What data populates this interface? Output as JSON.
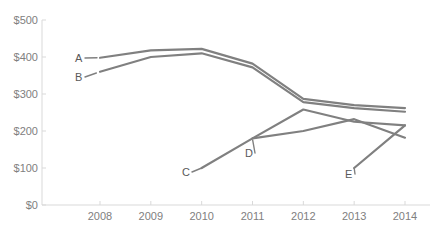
{
  "chart_data": {
    "type": "line",
    "title": "",
    "xlabel": "",
    "ylabel": "",
    "x": [
      2008,
      2009,
      2010,
      2011,
      2012,
      2013,
      2014
    ],
    "categories": [
      "2008",
      "2009",
      "2010",
      "2011",
      "2012",
      "2013",
      "2014"
    ],
    "ylim": [
      0,
      500
    ],
    "ytick_values": [
      0,
      100,
      200,
      300,
      400,
      500
    ],
    "ytick_labels": [
      "$0",
      "$100",
      "$200",
      "$300",
      "$400",
      "$500"
    ],
    "grid": false,
    "legend": "inline-labels",
    "line_color": "#808080",
    "axis_color": "#d9d9d9",
    "text_color": "#808080",
    "series": [
      {
        "name": "A",
        "label": "A",
        "x": [
          2008,
          2009,
          2010,
          2011,
          2012,
          2013,
          2014
        ],
        "values": [
          398,
          418,
          422,
          382,
          287,
          270,
          262
        ]
      },
      {
        "name": "B",
        "label": "B",
        "x": [
          2008,
          2009,
          2010,
          2011,
          2012,
          2013,
          2014
        ],
        "values": [
          360,
          400,
          410,
          372,
          278,
          262,
          252
        ]
      },
      {
        "name": "C",
        "label": "C",
        "x": [
          2010,
          2011,
          2012,
          2013,
          2014
        ],
        "values": [
          100,
          180,
          258,
          225,
          215
        ]
      },
      {
        "name": "D",
        "label": "D",
        "x": [
          2011,
          2012,
          2013,
          2014
        ],
        "values": [
          180,
          200,
          232,
          182
        ]
      },
      {
        "name": "E",
        "label": "E",
        "x": [
          2013,
          2014
        ],
        "values": [
          100,
          215
        ]
      }
    ]
  },
  "axis": {
    "y_labels": [
      {
        "text": "$500",
        "value": 500
      },
      {
        "text": "$400",
        "value": 400
      },
      {
        "text": "$300",
        "value": 300
      },
      {
        "text": "$200",
        "value": 200
      },
      {
        "text": "$100",
        "value": 100
      },
      {
        "text": "$0",
        "value": 0
      }
    ],
    "x_labels": [
      {
        "text": "2008",
        "value": 2008
      },
      {
        "text": "2009",
        "value": 2009
      },
      {
        "text": "2010",
        "value": 2010
      },
      {
        "text": "2011",
        "value": 2011
      },
      {
        "text": "2012",
        "value": 2012
      },
      {
        "text": "2013",
        "value": 2013
      },
      {
        "text": "2014",
        "value": 2014
      }
    ]
  },
  "series_labels": [
    {
      "text": "A",
      "x": 75,
      "y": 53
    },
    {
      "text": "B",
      "x": 75,
      "y": 72
    },
    {
      "text": "C",
      "x": 182,
      "y": 167
    },
    {
      "text": "D",
      "x": 245,
      "y": 148
    },
    {
      "text": "E",
      "x": 345,
      "y": 169
    }
  ]
}
